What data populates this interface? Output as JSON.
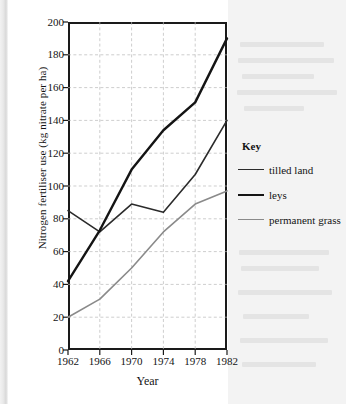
{
  "figure": {
    "y_axis": {
      "title": "Nitrogen fertiliser use (kg nitrate per ha)",
      "ticks": [
        "0",
        "20",
        "40",
        "60",
        "80",
        "100",
        "120",
        "140",
        "160",
        "180",
        "200"
      ]
    },
    "x_axis": {
      "title": "Year",
      "ticks": [
        "1962",
        "1966",
        "1970",
        "1974",
        "1978",
        "1982"
      ]
    },
    "legend": {
      "title": "Key",
      "items": [
        {
          "label": "tilled land",
          "color": "#2b2b2b",
          "width": 1.6
        },
        {
          "label": "leys",
          "color": "#141414",
          "width": 2.4
        },
        {
          "label": "permanent grass",
          "color": "#8a8a8a",
          "width": 1.6
        }
      ]
    }
  },
  "chart_data": {
    "type": "line",
    "title": "",
    "xlabel": "Year",
    "ylabel": "Nitrogen fertiliser use (kg nitrate per ha)",
    "x": [
      1962,
      1966,
      1970,
      1974,
      1978,
      1982
    ],
    "categories": [
      "1962",
      "1966",
      "1970",
      "1974",
      "1978",
      "1982"
    ],
    "xlim": [
      1962,
      1982
    ],
    "ylim": [
      0,
      200
    ],
    "ytick_step": 20,
    "grid": "dashed-both",
    "legend_position": "right",
    "series": [
      {
        "name": "tilled land",
        "color": "#2b2b2b",
        "values": [
          85,
          72,
          89,
          84,
          107,
          140
        ]
      },
      {
        "name": "leys",
        "color": "#141414",
        "values": [
          42,
          73,
          110,
          134,
          151,
          190
        ]
      },
      {
        "name": "permanent grass",
        "color": "#8a8a8a",
        "values": [
          20,
          31,
          50,
          72,
          89,
          97
        ]
      }
    ]
  }
}
